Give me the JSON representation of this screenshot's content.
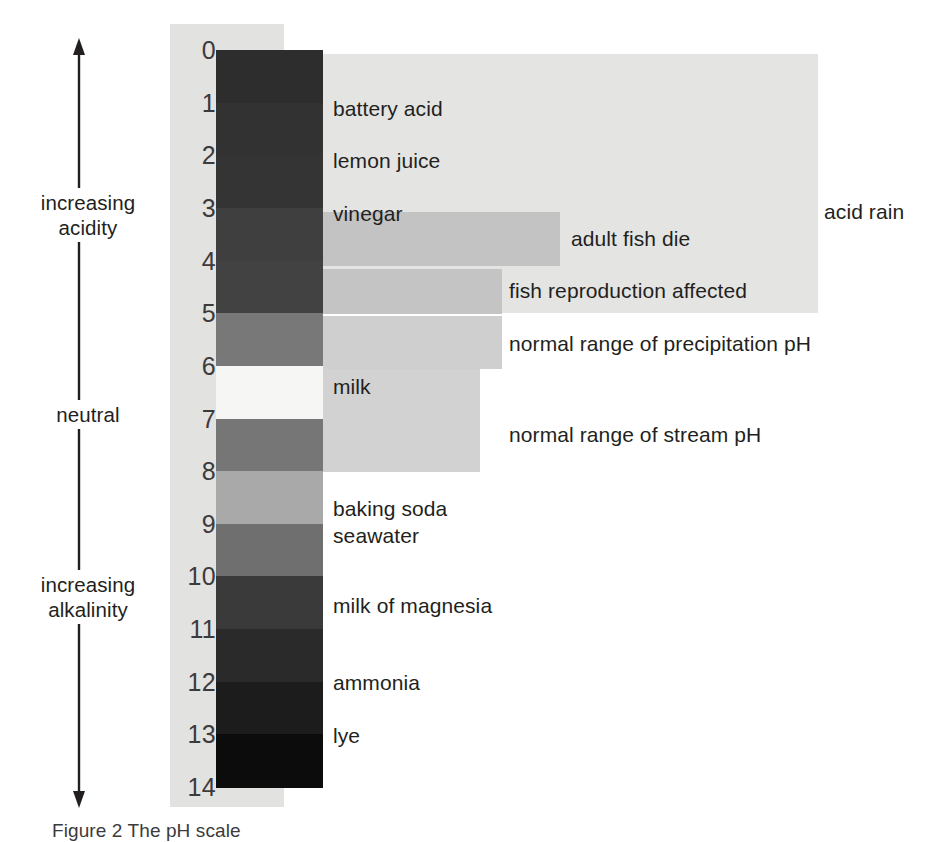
{
  "figure": {
    "caption": "Figure 2 The pH scale",
    "axis_arrow_icon": "double-headed-vertical-arrow-icon"
  },
  "axis": {
    "labels": [
      {
        "id": "increasing-acidity",
        "text": "increasing\nacidity"
      },
      {
        "id": "neutral",
        "text": "neutral"
      },
      {
        "id": "increasing-alkalinity",
        "text": "increasing\nalkalinity"
      }
    ],
    "acidity_line1": "increasing",
    "acidity_line2": "acidity",
    "neutral": "neutral",
    "alkalinity_line1": "increasing",
    "alkalinity_line2": "alkalinity"
  },
  "scale": {
    "ticks": [
      "0",
      "1",
      "2",
      "3",
      "4",
      "5",
      "6",
      "7",
      "8",
      "9",
      "10",
      "11",
      "12",
      "13",
      "14"
    ],
    "backing_color": "#e2e2e1"
  },
  "captions": {
    "battery_acid": "battery acid",
    "lemon_juice": "lemon juice",
    "vinegar": "vinegar",
    "adult_fish_die": "adult fish die",
    "fish_reproduction_affected": "fish reproduction affected",
    "acid_rain": "acid rain",
    "normal_range_precipitation": "normal range of precipitation pH",
    "milk": "milk",
    "normal_range_stream": "normal range of stream pH",
    "baking_soda": "baking soda",
    "seawater": "seawater",
    "milk_of_magnesia": "milk of magnesia",
    "ammonia": "ammonia",
    "lye": "lye"
  },
  "chart_data": {
    "type": "bar",
    "title": "Figure 2 The pH scale",
    "xlabel": "",
    "ylabel": "pH",
    "ylim": [
      0,
      14
    ],
    "grid": false,
    "legend": "none",
    "orientation": "vertical-gradient-strip",
    "categories": [
      "0-1",
      "1-2",
      "2-3",
      "3-4",
      "4-5",
      "5-6",
      "6-7",
      "7-8",
      "8-9",
      "9-10",
      "10-11",
      "11-12",
      "12-13",
      "13-14"
    ],
    "ph_strip_segments": [
      {
        "ph_from": 0,
        "ph_to": 1,
        "color": "#2e2d2d"
      },
      {
        "ph_from": 1,
        "ph_to": 2,
        "color": "#333232"
      },
      {
        "ph_from": 2,
        "ph_to": 3,
        "color": "#353434"
      },
      {
        "ph_from": 3,
        "ph_to": 4,
        "color": "#403f3f"
      },
      {
        "ph_from": 4,
        "ph_to": 5,
        "color": "#434242"
      },
      {
        "ph_from": 5,
        "ph_to": 6,
        "color": "#787878"
      },
      {
        "ph_from": 6,
        "ph_to": 7,
        "color": "#f6f6f4"
      },
      {
        "ph_from": 7,
        "ph_to": 8,
        "color": "#767676"
      },
      {
        "ph_from": 8,
        "ph_to": 9,
        "color": "#a9a9a9"
      },
      {
        "ph_from": 9,
        "ph_to": 10,
        "color": "#6f6f6f"
      },
      {
        "ph_from": 10,
        "ph_to": 11,
        "color": "#3b3a3a"
      },
      {
        "ph_from": 11,
        "ph_to": 12,
        "color": "#2b2a2a"
      },
      {
        "ph_from": 12,
        "ph_to": 13,
        "color": "#1d1c1c"
      },
      {
        "ph_from": 13,
        "ph_to": 14,
        "color": "#0c0c0c"
      }
    ],
    "substance_markers": [
      {
        "label": "battery acid",
        "ph": 1
      },
      {
        "label": "lemon juice",
        "ph": 2
      },
      {
        "label": "vinegar",
        "ph": 3
      },
      {
        "label": "milk",
        "ph": 6.5
      },
      {
        "label": "baking soda",
        "ph": 8.7
      },
      {
        "label": "seawater",
        "ph": 9.2
      },
      {
        "label": "milk of magnesia",
        "ph": 10.5
      },
      {
        "label": "ammonia",
        "ph": 12
      },
      {
        "label": "lye",
        "ph": 13
      }
    ],
    "range_bands": [
      {
        "label": "acid rain",
        "ph_from": 0.1,
        "ph_to": 5.0,
        "color": "#e4e4e3"
      },
      {
        "label": "adult fish die",
        "ph_from": 3.1,
        "ph_to": 4.1,
        "color": "#c3c3c3"
      },
      {
        "label": "fish reproduction affected",
        "ph_from": 4.2,
        "ph_to": 5.0,
        "color": "#c4c4c4"
      },
      {
        "label": "normal range of precipitation pH",
        "ph_from": 5.1,
        "ph_to": 6.1,
        "color": "#cfcfcf"
      },
      {
        "label": "normal range of stream pH",
        "ph_from": 6.1,
        "ph_to": 8.0,
        "color": "#d2d2d2"
      }
    ],
    "axis_annotations": [
      {
        "label": "increasing acidity",
        "direction": "up",
        "near_ph": 3
      },
      {
        "label": "neutral",
        "direction": "none",
        "near_ph": 7
      },
      {
        "label": "increasing alkalinity",
        "direction": "down",
        "near_ph": 11
      }
    ]
  }
}
